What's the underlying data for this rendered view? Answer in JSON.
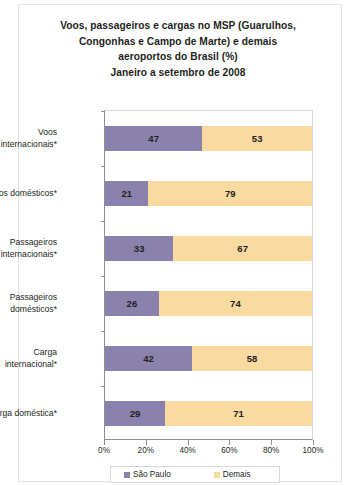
{
  "chart_data": {
    "type": "bar",
    "orientation": "horizontal",
    "stacked": true,
    "normalized_percent": true,
    "title": "Voos, passageiros e cargas no MSP (Guarulhos, Congonhas e Campo de Marte) e demais aeroportos do Brasil (%) Janeiro a setembro de 2008",
    "title_lines": [
      "Voos, passageiros e cargas no MSP (Guarulhos,",
      "Congonhas e Campo de Marte) e demais",
      "aeroportos do Brasil (%)",
      "Janeiro a setembro de 2008"
    ],
    "xlabel": "",
    "ylabel": "",
    "xlim": [
      0,
      100
    ],
    "xticks": [
      0,
      20,
      40,
      60,
      80,
      100
    ],
    "xtick_labels": [
      "0%",
      "20%",
      "40%",
      "60%",
      "80%",
      "100%"
    ],
    "grid": false,
    "legend_position": "bottom",
    "categories": [
      "Voos internacionais*",
      "Voos domésticos*",
      "Passageiros internacionais*",
      "Passageiros domésticos*",
      "Carga internacional*",
      "Carga doméstica*"
    ],
    "category_lines": [
      [
        "Voos",
        "internacionais*"
      ],
      [
        "Voos domésticos*"
      ],
      [
        "Passageiros",
        "internacionais*"
      ],
      [
        "Passageiros",
        "domésticos*"
      ],
      [
        "Carga",
        "internacional*"
      ],
      [
        "Carga doméstica*"
      ]
    ],
    "series": [
      {
        "name": "São Paulo",
        "color": "#8a82ad",
        "values": [
          47,
          21,
          33,
          26,
          42,
          29
        ]
      },
      {
        "name": "Demais",
        "color": "#f9dba2",
        "values": [
          53,
          79,
          67,
          74,
          58,
          71
        ]
      }
    ]
  },
  "legend": {
    "items": [
      {
        "label": "São Paulo",
        "color": "#8a82ad"
      },
      {
        "label": "Demais",
        "color": "#f9dba2"
      }
    ]
  },
  "colors": {
    "sao_paulo": "#8a82ad",
    "demais": "#f9dba2",
    "axis": "#8e8e8e",
    "frame": "#e3e3e3",
    "text": "#231f20",
    "background": "#ffffff"
  }
}
